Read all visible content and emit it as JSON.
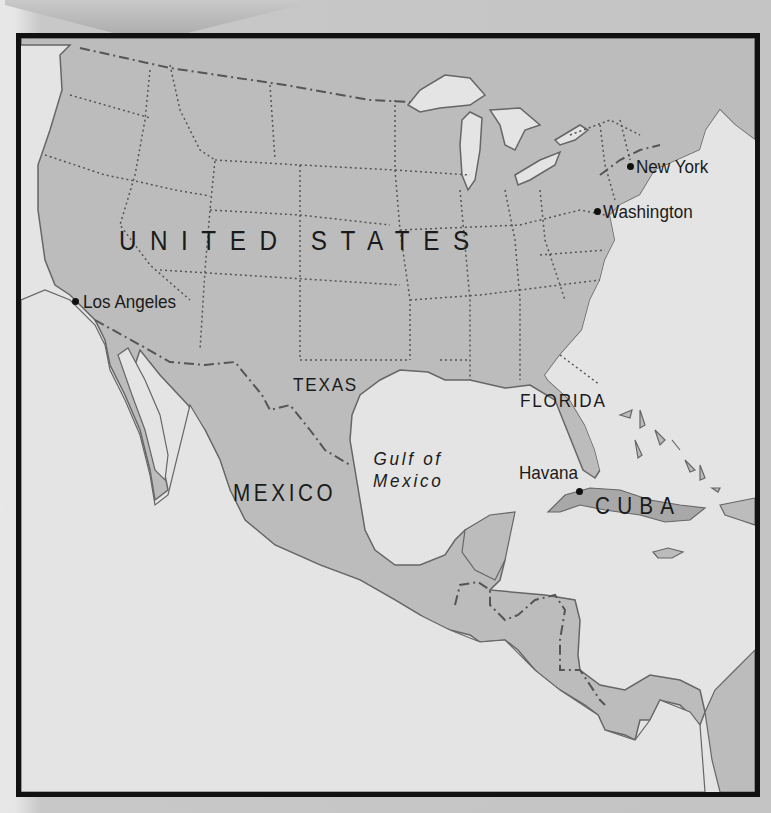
{
  "map": {
    "countries": {
      "united_states": "UNITED STATES",
      "mexico": "MEXICO",
      "cuba": "CUBA"
    },
    "states": {
      "texas": "TEXAS",
      "florida": "FLORIDA"
    },
    "water_bodies": {
      "gulf_line1": "Gulf of",
      "gulf_line2": "Mexico"
    },
    "cities": [
      {
        "name": "New York"
      },
      {
        "name": "Washington"
      },
      {
        "name": "Los Angeles"
      },
      {
        "name": "Havana"
      }
    ],
    "colors": {
      "land": "#bcbcbc",
      "water": "#e4e4e4",
      "frame": "#111111",
      "border_line": "#555555"
    }
  }
}
